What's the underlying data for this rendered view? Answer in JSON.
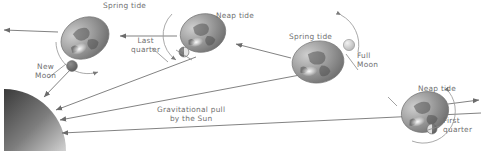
{
  "diagram": {
    "background_color": "#ffffff",
    "text_color": "#6f6f6f",
    "line_color": "#6b6b6b"
  },
  "sun": {
    "name": "Sun",
    "shape": "quarter-disc",
    "gradient_from": "#3a3a3a",
    "gradient_to": "#c9c9c9"
  },
  "labels": [
    {
      "id": "spring-tide-1",
      "text": "Spring tide",
      "x": 103,
      "y": 2
    },
    {
      "id": "new-moon",
      "text": "New\nMoon",
      "x": 35,
      "y": 63
    },
    {
      "id": "last-quarter",
      "text": "Last\nquarter",
      "x": 131,
      "y": 37
    },
    {
      "id": "neap-tide-1",
      "text": "Neap tide",
      "x": 216,
      "y": 12
    },
    {
      "id": "spring-tide-2",
      "text": "Spring tide",
      "x": 289,
      "y": 33
    },
    {
      "id": "full-moon",
      "text": "Full\nMoon",
      "x": 357,
      "y": 52
    },
    {
      "id": "gravitational-pull",
      "text": "Gravitational pull\nby the Sun",
      "x": 157,
      "y": 106
    },
    {
      "id": "neap-tide-2",
      "text": "Neap tide",
      "x": 418,
      "y": 85
    },
    {
      "id": "first-quarter",
      "text": "First\nquarter",
      "x": 443,
      "y": 117
    }
  ],
  "earths": [
    {
      "id": "earth-new-moon",
      "phase_label": "New Moon",
      "tide": "Spring tide",
      "cx": 85,
      "cy": 38
    },
    {
      "id": "earth-last-quarter",
      "phase_label": "Last quarter",
      "tide": "Neap tide",
      "cx": 203,
      "cy": 33
    },
    {
      "id": "earth-full-moon",
      "phase_label": "Full Moon",
      "tide": "Spring tide",
      "cx": 318,
      "cy": 62
    },
    {
      "id": "earth-first-quarter",
      "phase_label": "First quarter",
      "tide": "Neap tide",
      "cx": 425,
      "cy": 112
    }
  ],
  "moons": [
    {
      "id": "moon-new",
      "phase": "new",
      "cx": 72,
      "cy": 66,
      "lit": "dark"
    },
    {
      "id": "moon-last-quarter",
      "phase": "last-quarter",
      "cx": 184,
      "cy": 52,
      "lit": "half"
    },
    {
      "id": "moon-full",
      "phase": "full",
      "cx": 349,
      "cy": 45,
      "lit": "bright"
    },
    {
      "id": "moon-first-quarter",
      "phase": "first-quarter",
      "cx": 432,
      "cy": 129,
      "lit": "half"
    }
  ]
}
